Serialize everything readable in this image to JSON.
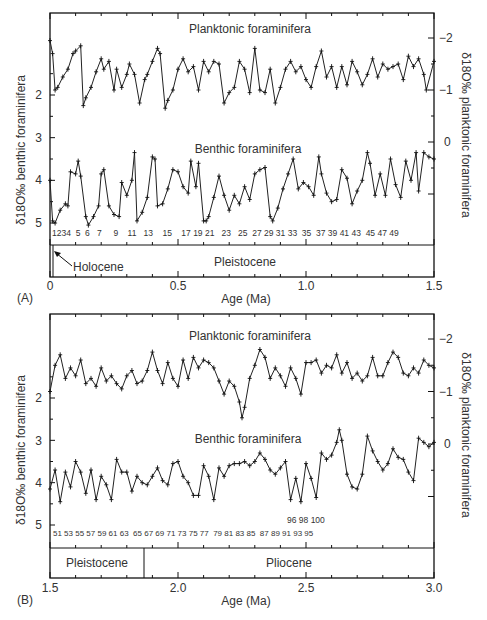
{
  "figure": {
    "panels": [
      {
        "id": "A",
        "panel_label": "(A)",
        "x_axis_label": "Age (Ma)",
        "x_ticks": [
          "0",
          "0.5",
          "1.0",
          "1.5"
        ],
        "left_axis_label": "δ18O‰ benthic foraminifera",
        "right_axis_label": "δ18O‰ planktonic foraminifera",
        "left_ticks": [
          "2",
          "3",
          "4",
          "5"
        ],
        "right_ticks": [
          "−2",
          "−1",
          "0"
        ],
        "planktonic_label": "Planktonic foraminifera",
        "benthic_label": "Benthic foraminifera",
        "epoch_labels": [
          "Pleistocene"
        ],
        "annotation": "Holocene",
        "mis_labels": "1234  5  6   7     9    11   13    15    17 19 21   23   25  27 29 31 33  35  37 39 41 43  45 47 49"
      },
      {
        "id": "B",
        "panel_label": "(B)",
        "x_axis_label": "Age (Ma)",
        "x_ticks": [
          "1.5",
          "2.0",
          "2.5",
          "3.0"
        ],
        "left_axis_label": "δ18O‰ benthic foraminifera",
        "right_axis_label": "δ18O‰ planktonic foraminifera",
        "left_ticks": [
          "2",
          "3",
          "4",
          "5"
        ],
        "right_ticks": [
          "−2",
          "−1",
          "0"
        ],
        "planktonic_label": "Planktonic foraminifera",
        "benthic_label": "Benthic foraminifera",
        "epoch_labels": [
          "Pleistocene",
          "Pliocene"
        ],
        "mis_labels_row1": "51 53 55 57 59 61 63  65 67 69 71 73 75 77  79 81 83 85  87 89 91 93 95",
        "mis_labels_row2": "96 98 100"
      }
    ]
  },
  "chart_data": [
    {
      "type": "line",
      "title": "(A) Oxygen isotope record 0–1.5 Ma",
      "xlabel": "Age (Ma)",
      "ylabel": "δ18O‰ benthic foraminifera",
      "y2label": "δ18O‰ planktonic foraminifera",
      "xlim": [
        0,
        1.5
      ],
      "ylim_left": [
        5.5,
        1.0
      ],
      "ylim_right": [
        0.5,
        -2.4
      ],
      "x_ticks": [
        0,
        0.5,
        1.0,
        1.5
      ],
      "left_ticks": [
        2,
        3,
        4,
        5
      ],
      "right_ticks": [
        -2,
        -1,
        0
      ],
      "legend": [
        "Planktonic foraminifera",
        "Benthic foraminifera"
      ],
      "epochs": [
        {
          "name": "Holocene",
          "from": 0,
          "to": 0.012
        },
        {
          "name": "Pleistocene",
          "from": 0.012,
          "to": 1.5
        }
      ],
      "series": [
        {
          "name": "Planktonic foraminifera",
          "axis": "right",
          "x": [
            0.0,
            0.01,
            0.02,
            0.03,
            0.05,
            0.07,
            0.09,
            0.1,
            0.12,
            0.13,
            0.14,
            0.16,
            0.18,
            0.2,
            0.21,
            0.23,
            0.25,
            0.26,
            0.28,
            0.3,
            0.31,
            0.33,
            0.35,
            0.37,
            0.38,
            0.4,
            0.42,
            0.43,
            0.45,
            0.46,
            0.48,
            0.5,
            0.52,
            0.54,
            0.56,
            0.58,
            0.6,
            0.62,
            0.64,
            0.66,
            0.68,
            0.7,
            0.72,
            0.74,
            0.76,
            0.78,
            0.8,
            0.82,
            0.84,
            0.86,
            0.88,
            0.9,
            0.92,
            0.94,
            0.96,
            0.98,
            1.0,
            1.02,
            1.04,
            1.06,
            1.08,
            1.1,
            1.12,
            1.14,
            1.16,
            1.18,
            1.2,
            1.22,
            1.24,
            1.26,
            1.28,
            1.3,
            1.32,
            1.34,
            1.36,
            1.38,
            1.4,
            1.42,
            1.44,
            1.46,
            1.47,
            1.5
          ],
          "values": [
            -1.95,
            -1.7,
            -1.0,
            -1.05,
            -1.25,
            -1.4,
            -1.7,
            -1.75,
            -1.85,
            -0.7,
            -0.85,
            -1.05,
            -1.35,
            -1.6,
            -1.4,
            -1.55,
            -1.0,
            -1.4,
            -1.05,
            -1.3,
            -1.5,
            -1.3,
            -0.75,
            -1.2,
            -1.3,
            -1.55,
            -1.8,
            -1.7,
            -0.65,
            -0.8,
            -1.0,
            -1.4,
            -1.6,
            -1.35,
            -1.45,
            -1.0,
            -1.55,
            -1.35,
            -1.55,
            -1.5,
            -0.75,
            -0.95,
            -1.05,
            -1.55,
            -1.4,
            -0.95,
            -1.8,
            -1.0,
            -0.95,
            -1.4,
            -0.75,
            -1.05,
            -1.4,
            -1.55,
            -1.35,
            -1.45,
            -1.2,
            -1.05,
            -1.45,
            -1.75,
            -1.25,
            -1.45,
            -1.05,
            -1.45,
            -1.1,
            -1.55,
            -1.35,
            -1.1,
            -1.3,
            -1.6,
            -1.25,
            -1.5,
            -1.4,
            -1.45,
            -1.5,
            -1.2,
            -1.65,
            -1.45,
            -1.6,
            -1.3,
            -1.0,
            -1.55
          ]
        },
        {
          "name": "Benthic foraminifera",
          "axis": "left",
          "x": [
            0.0,
            0.01,
            0.02,
            0.04,
            0.06,
            0.07,
            0.08,
            0.1,
            0.11,
            0.12,
            0.14,
            0.15,
            0.17,
            0.19,
            0.2,
            0.21,
            0.23,
            0.25,
            0.27,
            0.28,
            0.3,
            0.32,
            0.33,
            0.34,
            0.36,
            0.38,
            0.4,
            0.41,
            0.42,
            0.44,
            0.46,
            0.48,
            0.5,
            0.52,
            0.54,
            0.55,
            0.57,
            0.58,
            0.6,
            0.61,
            0.62,
            0.64,
            0.66,
            0.68,
            0.7,
            0.72,
            0.74,
            0.76,
            0.78,
            0.8,
            0.82,
            0.84,
            0.86,
            0.87,
            0.89,
            0.91,
            0.93,
            0.95,
            0.97,
            0.99,
            1.01,
            1.03,
            1.05,
            1.06,
            1.08,
            1.1,
            1.12,
            1.14,
            1.16,
            1.18,
            1.2,
            1.22,
            1.24,
            1.25,
            1.27,
            1.29,
            1.31,
            1.33,
            1.35,
            1.37,
            1.39,
            1.41,
            1.43,
            1.44,
            1.46,
            1.48,
            1.5
          ],
          "values": [
            4.0,
            4.95,
            5.0,
            4.7,
            4.55,
            4.6,
            3.8,
            3.85,
            3.55,
            3.9,
            4.85,
            5.05,
            4.85,
            4.6,
            3.85,
            3.75,
            4.6,
            4.8,
            4.85,
            4.05,
            4.35,
            4.0,
            3.35,
            4.95,
            4.75,
            4.4,
            3.45,
            3.5,
            4.6,
            4.55,
            4.2,
            3.75,
            3.8,
            4.15,
            4.3,
            3.55,
            4.15,
            3.6,
            4.95,
            4.95,
            4.85,
            4.4,
            3.9,
            4.35,
            4.7,
            4.35,
            4.55,
            4.15,
            4.45,
            3.85,
            3.75,
            3.7,
            4.85,
            4.95,
            4.65,
            4.2,
            3.85,
            3.5,
            4.2,
            4.05,
            4.15,
            4.35,
            3.45,
            3.85,
            4.3,
            4.5,
            4.45,
            3.75,
            3.95,
            4.55,
            4.25,
            4.0,
            3.35,
            3.6,
            4.35,
            3.85,
            4.35,
            3.5,
            4.1,
            4.4,
            3.55,
            4.0,
            3.35,
            4.25,
            3.35,
            3.45,
            3.5
          ]
        }
      ],
      "mis_stage_labels": [
        "1",
        "2",
        "3",
        "4",
        "5",
        "6",
        "7",
        "9",
        "11",
        "13",
        "15",
        "17",
        "19",
        "21",
        "23",
        "25",
        "27",
        "29",
        "31",
        "33",
        "35",
        "37",
        "39",
        "41",
        "43",
        "45",
        "47",
        "49"
      ]
    },
    {
      "type": "line",
      "title": "(B) Oxygen isotope record 1.5–3.0 Ma",
      "xlabel": "Age (Ma)",
      "ylabel": "δ18O‰ benthic foraminifera",
      "y2label": "δ18O‰ planktonic foraminifera",
      "xlim": [
        1.5,
        3.0
      ],
      "ylim_left": [
        5.5,
        1.0
      ],
      "ylim_right": [
        0.5,
        -2.4
      ],
      "x_ticks": [
        1.5,
        2.0,
        2.5,
        3.0
      ],
      "left_ticks": [
        2,
        3,
        4,
        5
      ],
      "right_ticks": [
        -2,
        -1,
        0
      ],
      "legend": [
        "Planktonic foraminifera",
        "Benthic foraminifera"
      ],
      "epochs": [
        {
          "name": "Pleistocene",
          "from": 1.5,
          "to": 1.865
        },
        {
          "name": "Pliocene",
          "from": 1.865,
          "to": 3.0
        }
      ],
      "series": [
        {
          "name": "Planktonic foraminifera",
          "axis": "right",
          "x": [
            1.5,
            1.52,
            1.54,
            1.56,
            1.58,
            1.6,
            1.62,
            1.64,
            1.66,
            1.68,
            1.7,
            1.72,
            1.74,
            1.76,
            1.78,
            1.8,
            1.82,
            1.84,
            1.86,
            1.88,
            1.9,
            1.92,
            1.94,
            1.96,
            1.98,
            2.0,
            2.02,
            2.04,
            2.06,
            2.08,
            2.1,
            2.12,
            2.14,
            2.16,
            2.18,
            2.2,
            2.22,
            2.24,
            2.25,
            2.26,
            2.28,
            2.3,
            2.32,
            2.34,
            2.36,
            2.38,
            2.4,
            2.42,
            2.44,
            2.46,
            2.48,
            2.5,
            2.52,
            2.54,
            2.56,
            2.58,
            2.6,
            2.62,
            2.64,
            2.66,
            2.68,
            2.7,
            2.72,
            2.74,
            2.76,
            2.78,
            2.8,
            2.82,
            2.84,
            2.86,
            2.88,
            2.9,
            2.92,
            2.94,
            2.96,
            2.98,
            3.0
          ],
          "values": [
            -1.0,
            -1.5,
            -1.7,
            -1.25,
            -1.45,
            -1.3,
            -1.6,
            -1.15,
            -1.25,
            -1.1,
            -1.45,
            -1.2,
            -1.3,
            -1.15,
            -1.05,
            -1.3,
            -1.4,
            -1.15,
            -1.2,
            -1.4,
            -1.75,
            -1.4,
            -1.15,
            -1.55,
            -1.25,
            -1.1,
            -1.6,
            -1.25,
            -1.65,
            -1.45,
            -1.6,
            -1.55,
            -1.45,
            -1.2,
            -0.95,
            -1.2,
            -1.1,
            -0.8,
            -0.5,
            -0.7,
            -1.25,
            -1.5,
            -1.8,
            -1.65,
            -1.25,
            -1.45,
            -1.3,
            -1.1,
            -1.45,
            -1.25,
            -0.95,
            -1.55,
            -1.55,
            -1.6,
            -1.35,
            -1.5,
            -1.45,
            -1.7,
            -1.35,
            -1.55,
            -1.25,
            -1.35,
            -1.2,
            -1.3,
            -1.65,
            -1.3,
            -1.3,
            -1.55,
            -1.75,
            -1.65,
            -1.35,
            -1.3,
            -1.45,
            -1.35,
            -1.6,
            -1.5,
            -1.45
          ]
        },
        {
          "name": "Benthic foraminifera",
          "axis": "left",
          "x": [
            1.5,
            1.52,
            1.54,
            1.56,
            1.58,
            1.6,
            1.62,
            1.64,
            1.66,
            1.68,
            1.7,
            1.72,
            1.74,
            1.76,
            1.78,
            1.8,
            1.82,
            1.84,
            1.86,
            1.88,
            1.9,
            1.92,
            1.94,
            1.96,
            1.98,
            2.0,
            2.02,
            2.04,
            2.06,
            2.08,
            2.1,
            2.12,
            2.14,
            2.16,
            2.18,
            2.2,
            2.22,
            2.24,
            2.26,
            2.28,
            2.3,
            2.32,
            2.34,
            2.36,
            2.38,
            2.4,
            2.42,
            2.44,
            2.46,
            2.48,
            2.5,
            2.52,
            2.54,
            2.56,
            2.58,
            2.6,
            2.62,
            2.63,
            2.64,
            2.66,
            2.68,
            2.7,
            2.72,
            2.74,
            2.76,
            2.78,
            2.8,
            2.82,
            2.84,
            2.86,
            2.88,
            2.9,
            2.92,
            2.94,
            2.96,
            2.98,
            3.0
          ],
          "values": [
            4.15,
            3.7,
            4.45,
            3.75,
            4.1,
            3.5,
            3.75,
            4.25,
            3.7,
            4.4,
            3.85,
            4.05,
            4.4,
            3.45,
            3.75,
            3.75,
            4.2,
            3.85,
            4.0,
            4.05,
            3.85,
            3.65,
            3.95,
            4.05,
            3.55,
            3.5,
            3.85,
            4.0,
            4.3,
            4.3,
            3.6,
            3.85,
            4.4,
            3.65,
            3.85,
            3.6,
            3.55,
            3.55,
            3.5,
            3.6,
            3.5,
            3.3,
            3.45,
            3.7,
            3.8,
            3.65,
            3.5,
            4.4,
            3.9,
            4.45,
            3.55,
            3.9,
            4.35,
            3.3,
            3.45,
            3.35,
            3.05,
            2.75,
            3.0,
            3.8,
            4.1,
            4.15,
            3.8,
            2.9,
            3.25,
            3.5,
            3.7,
            3.55,
            3.2,
            3.4,
            3.45,
            3.75,
            3.95,
            2.95,
            3.05,
            3.15,
            3.05
          ]
        }
      ],
      "mis_stage_labels": [
        "51",
        "53",
        "55",
        "57",
        "59",
        "61",
        "63",
        "65",
        "67",
        "69",
        "71",
        "73",
        "75",
        "77",
        "79",
        "81",
        "83",
        "85",
        "87",
        "89",
        "91",
        "93",
        "95",
        "96",
        "98",
        "100"
      ]
    }
  ]
}
